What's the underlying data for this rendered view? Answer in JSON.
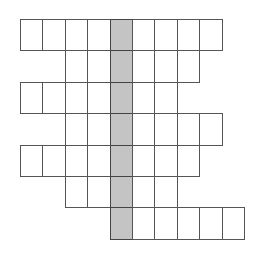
{
  "puzzle": {
    "type": "crossword-grid",
    "origin_x": 20,
    "origin_y": 19,
    "cell_width": 22.4,
    "cell_height": 31.4,
    "columns": 11,
    "shaded_column": 4,
    "colors": {
      "line": "#555555",
      "shaded_fill": "#c4c4c4",
      "cell_fill": "#ffffff"
    },
    "rows": [
      {
        "start": 0,
        "end": 8
      },
      {
        "start": 2,
        "end": 7
      },
      {
        "start": 0,
        "end": 6
      },
      {
        "start": 2,
        "end": 8
      },
      {
        "start": 0,
        "end": 7
      },
      {
        "start": 2,
        "end": 6
      },
      {
        "start": 4,
        "end": 9
      }
    ]
  }
}
